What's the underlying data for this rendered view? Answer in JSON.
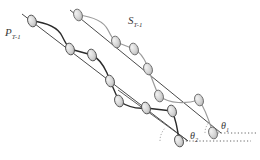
{
  "figure": {
    "background": "#ffffff",
    "width": 260,
    "height": 160,
    "colors": {
      "dark_chain": "#2b2b2b",
      "light_chain": "#9b9b9b",
      "axis_line": "#4a4a4a",
      "node_fill": "#d4d4d4",
      "node_stroke": "#555555",
      "dotted_line": "#555555",
      "arc": "#777777",
      "text": "#3a3a3a"
    },
    "labels": {
      "p_chain": {
        "base": "P",
        "sub": "T-1",
        "x": 5,
        "y": 27
      },
      "s_chain": {
        "base": "S",
        "sub": "T-1",
        "x": 128,
        "y": 15
      },
      "theta_one": {
        "base": "θ",
        "sub": "1",
        "x": 221,
        "y": 121
      },
      "theta_two": {
        "base": "θ",
        "sub": "2",
        "x": 190,
        "y": 131
      }
    },
    "axes": [
      {
        "name": "p-axis-line",
        "x1": 22,
        "y1": 14,
        "x2": 188,
        "y2": 141
      },
      {
        "name": "s-axis-line",
        "x1": 70,
        "y1": 10,
        "x2": 221,
        "y2": 133
      },
      {
        "name": "inner-line",
        "x1": 120,
        "y1": 92,
        "x2": 188,
        "y2": 141
      }
    ],
    "dotted_lines": [
      {
        "name": "theta1-baseline",
        "x1": 221,
        "y1": 133,
        "x2": 256,
        "y2": 133
      },
      {
        "name": "theta2-baseline",
        "x1": 188,
        "y1": 141,
        "x2": 250,
        "y2": 141
      }
    ],
    "arcs": [
      {
        "name": "theta1-arc",
        "cx": 221,
        "cy": 133,
        "r": 20,
        "start": 180,
        "end": 232
      },
      {
        "name": "theta2-arc",
        "cx": 188,
        "cy": 141,
        "r": 24,
        "start": 180,
        "end": 233
      }
    ],
    "dark_chain_nodes": [
      {
        "x": 32,
        "y": 21
      },
      {
        "x": 70,
        "y": 49
      },
      {
        "x": 92,
        "y": 55
      },
      {
        "x": 110,
        "y": 81
      },
      {
        "x": 119,
        "y": 101
      },
      {
        "x": 146,
        "y": 108
      },
      {
        "x": 172,
        "y": 111
      },
      {
        "x": 179,
        "y": 141
      }
    ],
    "light_chain_nodes": [
      {
        "x": 78,
        "y": 15
      },
      {
        "x": 116,
        "y": 42
      },
      {
        "x": 134,
        "y": 49
      },
      {
        "x": 148,
        "y": 69
      },
      {
        "x": 159,
        "y": 96
      },
      {
        "x": 199,
        "y": 100
      },
      {
        "x": 213,
        "y": 133
      }
    ],
    "node_shape": {
      "rx": 4.2,
      "ry": 6.0,
      "rotation_deg": -20
    }
  }
}
